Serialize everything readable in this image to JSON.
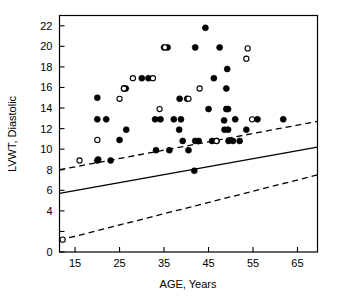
{
  "chart_data": {
    "type": "scatter",
    "title": "",
    "xlabel": "AGE, Years",
    "ylabel": "LVWT, Diastolic",
    "xlim": [
      11.5,
      69.5
    ],
    "ylim": [
      0,
      23
    ],
    "xticks": [
      15,
      25,
      35,
      45,
      55,
      65
    ],
    "yticks": [
      0,
      2,
      4,
      6,
      8,
      10,
      12,
      14,
      16,
      18,
      20,
      22
    ],
    "ytick_labels": [
      "0",
      "2",
      "4",
      "6",
      "8",
      "10",
      "12",
      "14",
      "16",
      "18",
      "20",
      "22"
    ],
    "ytick_labels_shown": [
      "0",
      "4",
      "6",
      "8",
      "10",
      "12",
      "14",
      "16",
      "18",
      "20",
      "22"
    ],
    "grid": false,
    "legend": null,
    "series": [
      {
        "name": "filled",
        "marker": "filled-circle",
        "color": "#000000",
        "points": [
          [
            20.0,
            15.0
          ],
          [
            20.0,
            12.9
          ],
          [
            22.0,
            12.9
          ],
          [
            20.0,
            8.9
          ],
          [
            20.2,
            9.0
          ],
          [
            23.0,
            8.9
          ],
          [
            25.0,
            10.9
          ],
          [
            26.5,
            11.9
          ],
          [
            26.0,
            15.9
          ],
          [
            26.4,
            15.9
          ],
          [
            30.0,
            16.9
          ],
          [
            31.5,
            16.9
          ],
          [
            33.0,
            12.9
          ],
          [
            34.2,
            12.9
          ],
          [
            33.2,
            9.9
          ],
          [
            35.0,
            19.9
          ],
          [
            35.8,
            19.9
          ],
          [
            36.2,
            9.9
          ],
          [
            37.2,
            12.9
          ],
          [
            38.8,
            12.9
          ],
          [
            38.5,
            14.9
          ],
          [
            40.2,
            14.9
          ],
          [
            38.4,
            11.9
          ],
          [
            39.2,
            10.8
          ],
          [
            40.5,
            9.9
          ],
          [
            42.0,
            10.8
          ],
          [
            42.8,
            10.8
          ],
          [
            41.8,
            7.9
          ],
          [
            44.3,
            21.8
          ],
          [
            42.0,
            19.9
          ],
          [
            45.0,
            13.9
          ],
          [
            46.2,
            16.9
          ],
          [
            45.8,
            10.8
          ],
          [
            46.8,
            10.8
          ],
          [
            47.5,
            19.9
          ],
          [
            49.0,
            13.9
          ],
          [
            49.4,
            13.9
          ],
          [
            49.2,
            17.8
          ],
          [
            49.0,
            15.9
          ],
          [
            48.5,
            12.8
          ],
          [
            48.6,
            11.9
          ],
          [
            49.4,
            11.9
          ],
          [
            49.5,
            10.8
          ],
          [
            50.5,
            10.8
          ],
          [
            51.0,
            12.9
          ],
          [
            52.0,
            10.8
          ],
          [
            53.5,
            11.9
          ],
          [
            56.0,
            12.9
          ],
          [
            61.8,
            12.9
          ]
        ]
      },
      {
        "name": "open",
        "marker": "open-circle",
        "color": "#000000",
        "points": [
          [
            16.0,
            8.9
          ],
          [
            20.0,
            10.9
          ],
          [
            25.0,
            14.9
          ],
          [
            26.0,
            15.9
          ],
          [
            28.0,
            16.9
          ],
          [
            32.5,
            16.9
          ],
          [
            34.0,
            13.9
          ],
          [
            35.2,
            19.9
          ],
          [
            40.5,
            14.9
          ],
          [
            43.0,
            15.9
          ],
          [
            46.8,
            10.8
          ],
          [
            53.8,
            19.8
          ],
          [
            53.5,
            18.8
          ],
          [
            54.8,
            12.9
          ],
          [
            12.2,
            1.2
          ]
        ]
      }
    ],
    "lines": [
      {
        "name": "regression-line",
        "style": "solid",
        "x0": 11.5,
        "y0": 5.7,
        "x1": 69.5,
        "y1": 10.2
      },
      {
        "name": "upper-limit-line",
        "style": "dashed",
        "x0": 11.5,
        "y0": 8.0,
        "x1": 69.5,
        "y1": 12.7
      },
      {
        "name": "lower-limit-line",
        "style": "dashed",
        "x0": 11.5,
        "y0": 1.15,
        "x1": 69.5,
        "y1": 7.5
      }
    ]
  },
  "figure": {
    "background_color": "#ffffff",
    "axis_color": "#000000",
    "marker_color": "#000000"
  }
}
